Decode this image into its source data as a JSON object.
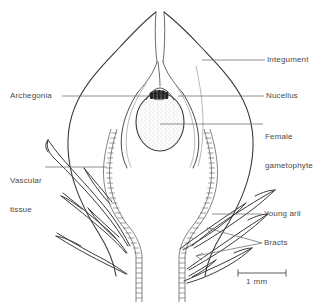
{
  "figure": {
    "background_color": "#ffffff",
    "ink_color": "#3a3a3a",
    "leader_color": "#6b6b6b",
    "text_color": "#4a4a4a"
  },
  "labels": {
    "integument": "Integument",
    "archegonia": "Archegonia",
    "nucellus": "Nucellus",
    "female_gametophyte_line1": "Female",
    "female_gametophyte_line2": "gametophyte",
    "vascular_line1": "Vascular",
    "vascular_line2": "tissue",
    "young_aril": "Young aril",
    "bracts": "Bracts"
  },
  "scale_bar": {
    "text": "1 mm",
    "length_px": 48
  }
}
